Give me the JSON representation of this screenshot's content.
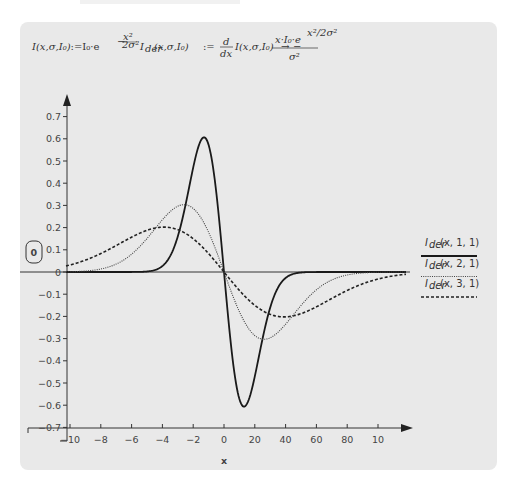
{
  "formulas": {
    "intensity": {
      "lhs": "I(x,σ,I₀)",
      "assign": ":=",
      "rhs_base": "I₀·e",
      "exponent_num": "x²",
      "exponent_den": "2σ²",
      "exponent_sign": "−"
    },
    "derivative": {
      "lhs": "I",
      "lhs_sub": "der",
      "lhs_args": "(x,σ,I₀)",
      "assign": ":=",
      "d_num": "d",
      "d_den": "dx",
      "d_arg": "I(x,σ,I₀)",
      "arrow": "→",
      "sign": "−",
      "result_num": "x·I₀·e",
      "result_num_exp": "x²/2σ²",
      "result_den": "σ²"
    }
  },
  "region_badge": "0",
  "chart_data": {
    "type": "line",
    "title": "",
    "xlabel": "x",
    "ylabel": "",
    "x_tick_labels": [
      "−10",
      "−8",
      "−6",
      "−4",
      "−2",
      "0",
      "20",
      "40",
      "60",
      "80",
      "10"
    ],
    "y_tick_labels": [
      "0.7",
      "0.6",
      "0.5",
      "0.4",
      "0.3",
      "0.2",
      "0.1",
      "0",
      "−0.1",
      "−0.2",
      "−0.3",
      "−0.4",
      "−0.5",
      "−0.6",
      "−0.7"
    ],
    "y_ticks": [
      0.7,
      0.6,
      0.5,
      0.4,
      0.3,
      0.2,
      0.1,
      0,
      -0.1,
      -0.2,
      -0.3,
      -0.4,
      -0.5,
      -0.6,
      -0.7
    ],
    "ylim": [
      -0.7,
      0.7
    ],
    "x_plot_range": [
      -7.9,
      9.1
    ],
    "grid": false,
    "legend_position": "right",
    "series": [
      {
        "name": "I_der(x, 1, 1)",
        "label_main": "I",
        "label_sub": "der",
        "label_args": "(x, 1, 1)",
        "sigma": 1,
        "I0": 1,
        "style": "solid",
        "peak": {
          "x": -1,
          "y": 0.607
        },
        "trough": {
          "x": 1,
          "y": -0.607
        }
      },
      {
        "name": "I_der(x, 2, 1)",
        "label_main": "I",
        "label_sub": "der",
        "label_args": "(x, 2, 1)",
        "sigma": 2,
        "I0": 1,
        "style": "dotted",
        "peak": {
          "x": -2,
          "y": 0.303
        },
        "trough": {
          "x": 2,
          "y": -0.303
        }
      },
      {
        "name": "I_der(x, 3, 1)",
        "label_main": "I",
        "label_sub": "der",
        "label_args": "(x, 3, 1)",
        "sigma": 3,
        "I0": 1,
        "style": "dashed",
        "peak": {
          "x": -3,
          "y": 0.202
        },
        "trough": {
          "x": 3,
          "y": -0.202
        }
      }
    ]
  },
  "colors": {
    "panel_bg": "#e9e9e9",
    "axis": "#333333",
    "series_solid": "#1a1a1a",
    "series_dotted": "#444444",
    "series_dashed": "#222222"
  }
}
